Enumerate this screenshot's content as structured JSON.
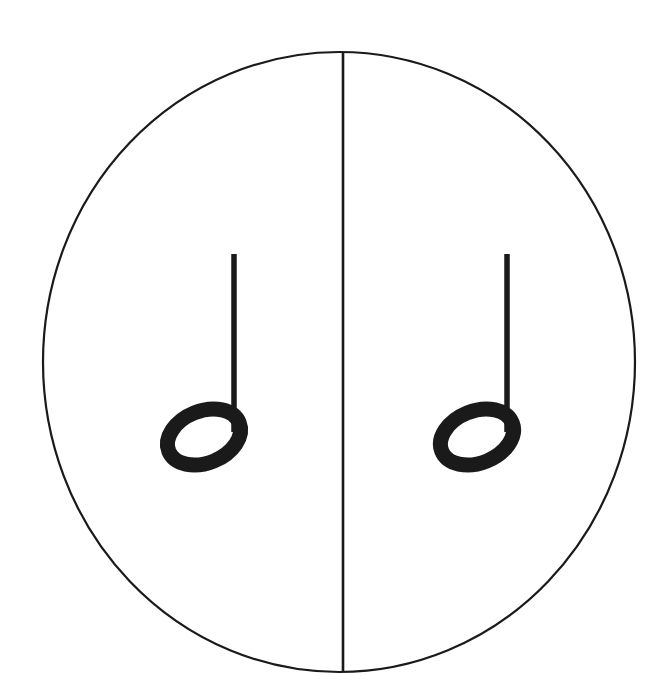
{
  "figure": {
    "kind": "music-notation-diagram",
    "canvas": {
      "width": 656,
      "height": 698,
      "background": "#ffffff"
    },
    "ink_color": "#1a1a1a",
    "circle": {
      "name": "whole-circle",
      "center_x": 339,
      "center_y": 362,
      "radius_x": 296,
      "radius_y": 310,
      "stroke_width": 2.2,
      "fill": "none"
    },
    "divider": {
      "name": "vertical-diameter",
      "x": 343,
      "y_top": 53,
      "y_bottom": 672,
      "stroke_width": 2.6
    },
    "notes": [
      {
        "label": "half-note-left",
        "half": "left",
        "value": "half note",
        "beats": 2,
        "notehead": {
          "center_x": 204,
          "center_y": 437,
          "radius_x": 38,
          "radius_y": 26,
          "rotation_deg": -22,
          "outline_width": 15,
          "filled": false
        },
        "stem": {
          "x": 234,
          "y_top": 254,
          "y_bottom": 432,
          "width": 5.5,
          "direction": "up"
        }
      },
      {
        "label": "half-note-right",
        "half": "right",
        "value": "half note",
        "beats": 2,
        "notehead": {
          "center_x": 477,
          "center_y": 437,
          "radius_x": 38,
          "radius_y": 26,
          "rotation_deg": -22,
          "outline_width": 15,
          "filled": false
        },
        "stem": {
          "x": 507,
          "y_top": 254,
          "y_bottom": 432,
          "width": 5.5,
          "direction": "up"
        }
      }
    ],
    "caption": ""
  }
}
